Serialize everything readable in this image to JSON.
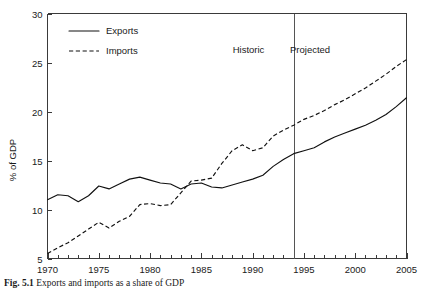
{
  "figure": {
    "caption_label": "Fig. 5.1",
    "caption_text": "Exports and imports as a share of GDP"
  },
  "chart_data": {
    "type": "line",
    "title": "",
    "xlabel": "",
    "ylabel": "% of GDP",
    "xlim": [
      1970,
      2005
    ],
    "ylim": [
      5,
      30
    ],
    "ytick_values": [
      5,
      10,
      15,
      20,
      25,
      30
    ],
    "ytick_labels": [
      "5",
      "10",
      "15",
      "20",
      "25",
      "30"
    ],
    "xtick_values": [
      1970,
      1975,
      1980,
      1985,
      1990,
      1995,
      2000,
      2005
    ],
    "xtick_labels": [
      "1970",
      "1975",
      "1980",
      "1985",
      "1990",
      "1995",
      "2000",
      "2005"
    ],
    "xtick_minor_step": 1,
    "grid": false,
    "legend_position": "top-left",
    "x": [
      1970,
      1971,
      1972,
      1973,
      1974,
      1975,
      1976,
      1977,
      1978,
      1979,
      1980,
      1981,
      1982,
      1983,
      1984,
      1985,
      1986,
      1987,
      1988,
      1989,
      1990,
      1991,
      1992,
      1993,
      1994,
      1995,
      1996,
      1997,
      1998,
      1999,
      2000,
      2001,
      2002,
      2003,
      2004,
      2005
    ],
    "series": [
      {
        "name": "Exports",
        "style": "solid",
        "color": "#111111",
        "values": [
          11.0,
          11.5,
          11.4,
          10.8,
          11.4,
          12.4,
          12.1,
          12.6,
          13.1,
          13.3,
          13.0,
          12.7,
          12.6,
          12.1,
          12.6,
          12.7,
          12.3,
          12.2,
          12.5,
          12.8,
          13.1,
          13.5,
          14.4,
          15.1,
          15.7,
          16.0,
          16.3,
          16.9,
          17.4,
          17.8,
          18.2,
          18.6,
          19.1,
          19.7,
          20.5,
          21.4
        ]
      },
      {
        "name": "Imports",
        "style": "dashed",
        "color": "#111111",
        "values": [
          5.5,
          6.1,
          6.6,
          7.3,
          8.0,
          8.7,
          8.1,
          8.8,
          9.3,
          10.5,
          10.6,
          10.4,
          10.5,
          11.7,
          12.9,
          13.0,
          13.2,
          14.7,
          16.0,
          16.6,
          16.0,
          16.3,
          17.5,
          18.1,
          18.6,
          19.2,
          19.6,
          20.1,
          20.7,
          21.2,
          21.8,
          22.4,
          23.1,
          23.8,
          24.6,
          25.3
        ]
      }
    ],
    "annotations": [
      {
        "name": "divider",
        "type": "vline",
        "x": 1994
      },
      {
        "name": "historic-label",
        "type": "text",
        "text": "Historic",
        "x": 1989.6,
        "y": 26.0
      },
      {
        "name": "projected-label",
        "type": "text",
        "text": "Projected",
        "x": 1995.6,
        "y": 26.0
      }
    ],
    "legend": [
      {
        "label": "Exports",
        "style": "solid"
      },
      {
        "label": "Imports",
        "style": "dashed"
      }
    ]
  }
}
